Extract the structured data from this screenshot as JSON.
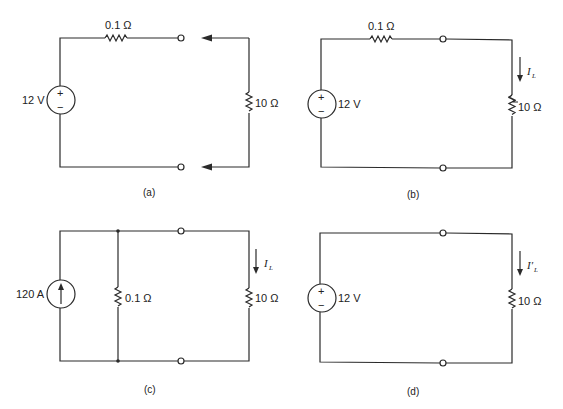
{
  "figure": {
    "panels": [
      {
        "id": "a",
        "caption": "(a)",
        "source": {
          "type": "voltage",
          "label": "12 V",
          "plus": "+",
          "minus": "−"
        },
        "series_resistor": "0.1 Ω",
        "load_resistor": "10 Ω",
        "note": "load disconnected, arrows indicate connection"
      },
      {
        "id": "b",
        "caption": "(b)",
        "source": {
          "type": "voltage",
          "label": "12 V",
          "plus": "+",
          "minus": "−"
        },
        "series_resistor": "0.1 Ω",
        "load_resistor": "10 Ω",
        "current_label": "I",
        "current_sub": "L"
      },
      {
        "id": "c",
        "caption": "(c)",
        "source": {
          "type": "current",
          "label": "120 A"
        },
        "shunt_resistor": "0.1 Ω",
        "load_resistor": "10 Ω",
        "current_label": "I",
        "current_sub": "L"
      },
      {
        "id": "d",
        "caption": "(d)",
        "source": {
          "type": "voltage",
          "label": "12 V",
          "plus": "+",
          "minus": "−"
        },
        "load_resistor": "10 Ω",
        "current_label": "I′",
        "current_sub": "L"
      }
    ]
  },
  "colors": {
    "line": "#2a2a2a",
    "text": "#222222",
    "background": "#ffffff"
  }
}
